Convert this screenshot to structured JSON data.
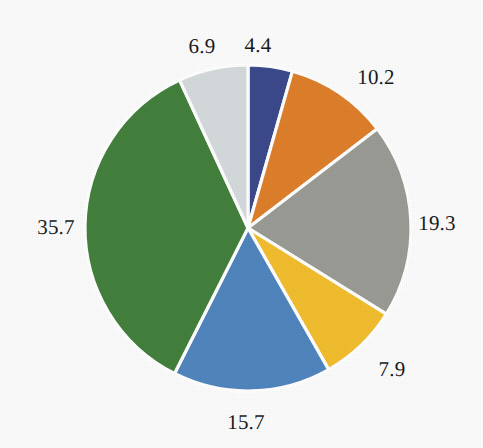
{
  "chart_data": {
    "type": "pie",
    "title": "",
    "subtitle": "",
    "xlabel": "",
    "ylabel": "",
    "grid": false,
    "legend": "none",
    "start_angle_deg": 0,
    "direction": "clockwise",
    "labels_position": "outside",
    "background_color": "#fcfcfc",
    "separator_color": "#ffffff",
    "total": 100.1,
    "categories": [
      "4.4",
      "10.2",
      "19.3",
      "7.9",
      "15.7",
      "35.7",
      "6.9"
    ],
    "values": [
      4.4,
      10.2,
      19.3,
      7.9,
      15.7,
      35.7,
      6.9
    ],
    "colors": [
      "#3b4a8c",
      "#de7f2b",
      "#9b9b96",
      "#f2be2e",
      "#5085be",
      "#43803c",
      "#d4dadc"
    ],
    "slices": [
      {
        "index": 0,
        "value": 4.4,
        "label": "4.4",
        "color": "#3b4a8c",
        "color_name": "dark-navy-blue",
        "label_x": 258,
        "label_y": 45
      },
      {
        "index": 1,
        "value": 10.2,
        "label": "10.2",
        "color": "#de7f2b",
        "color_name": "orange",
        "label_x": 376,
        "label_y": 77
      },
      {
        "index": 2,
        "value": 19.3,
        "label": "19.3",
        "color": "#9b9b96",
        "color_name": "medium-gray",
        "label_x": 437,
        "label_y": 223
      },
      {
        "index": 3,
        "value": 7.9,
        "label": "7.9",
        "color": "#f2be2e",
        "color_name": "golden-yellow",
        "label_x": 392,
        "label_y": 369
      },
      {
        "index": 4,
        "value": 15.7,
        "label": "15.7",
        "color": "#5085be",
        "color_name": "medium-blue",
        "label_x": 246,
        "label_y": 422
      },
      {
        "index": 5,
        "value": 35.7,
        "label": "35.7",
        "color": "#43803c",
        "color_name": "green",
        "label_x": 56,
        "label_y": 227
      },
      {
        "index": 6,
        "value": 6.9,
        "label": "6.9",
        "color": "#d4dadc",
        "color_name": "light-gray",
        "label_x": 202,
        "label_y": 46
      }
    ],
    "geometry": {
      "center_x": 248,
      "center_y": 228,
      "radius": 163
    }
  }
}
